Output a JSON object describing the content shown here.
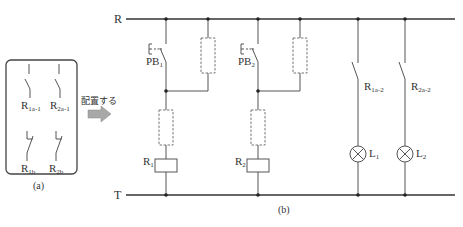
{
  "panel_a": {
    "caption": "(a)",
    "contacts": [
      {
        "base": "R",
        "sub": "1a-1",
        "type": "normally-open"
      },
      {
        "base": "R",
        "sub": "2a-1",
        "type": "normally-open"
      },
      {
        "base": "R",
        "sub": "1b",
        "type": "normally-closed"
      },
      {
        "base": "R",
        "sub": "2b",
        "type": "normally-closed"
      }
    ]
  },
  "arrow": {
    "label": "配置する"
  },
  "panel_b": {
    "caption": "(b)",
    "rails": {
      "top": "R",
      "bottom": "T"
    },
    "pushbuttons": [
      {
        "base": "PB",
        "sub": "1"
      },
      {
        "base": "PB",
        "sub": "2"
      }
    ],
    "relays": [
      {
        "base": "R",
        "sub": "1"
      },
      {
        "base": "R",
        "sub": "2"
      }
    ],
    "output_contacts": [
      {
        "base": "R",
        "sub": "1a-2"
      },
      {
        "base": "R",
        "sub": "2a-2"
      }
    ],
    "lamps": [
      {
        "base": "L",
        "sub": "1"
      },
      {
        "base": "L",
        "sub": "2"
      }
    ]
  },
  "colors": {
    "line": "#555555",
    "rail": "#333333",
    "dashed": "#777777",
    "arrow": "#999999"
  }
}
